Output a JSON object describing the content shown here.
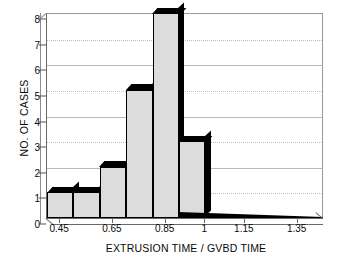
{
  "chart_data": {
    "type": "bar",
    "title": "",
    "subtitle": "",
    "xlabel": "EXTRUSION TIME / GVBD TIME",
    "ylabel": "NO. OF CASES",
    "ylim": [
      0,
      8
    ],
    "yticks": [
      0,
      1,
      2,
      3,
      4,
      5,
      6,
      7,
      8
    ],
    "ytick_labels": [
      "0",
      "1",
      "2",
      "3",
      "4",
      "5",
      "6",
      "7",
      "8"
    ],
    "xtick_labels": [
      "0.45",
      "0.65",
      "0.85",
      "1",
      "1.15",
      "1.35"
    ],
    "xtick_values": [
      0.45,
      0.65,
      0.85,
      1.0,
      1.15,
      1.35
    ],
    "xlim": [
      0.4,
      1.45
    ],
    "bin_width": 0.1,
    "categories": [
      "0.40-0.50",
      "0.50-0.60",
      "0.60-0.70",
      "0.70-0.80",
      "0.80-0.90",
      "0.90-1.00",
      "1.00-1.10",
      "1.10-1.20",
      "1.20-1.30",
      "1.30-1.40",
      "1.40-1.45"
    ],
    "bin_starts": [
      0.4,
      0.5,
      0.6,
      0.7,
      0.8,
      0.9,
      1.0,
      1.1,
      1.2,
      1.3,
      1.4
    ],
    "values": [
      1,
      1,
      2,
      5,
      8,
      3,
      0,
      0,
      0,
      0,
      0
    ],
    "total_cases": 20,
    "grid": true,
    "grid_axis": "y",
    "legend": "none",
    "style": "3d-histogram",
    "bar_fill": "#dcdcdc",
    "bar_edge": "#000000",
    "grid_color": "#b9b9b9",
    "axis_color": "#6a6a6a",
    "text_color": "#0a0a0a",
    "background": "#ffffff"
  }
}
